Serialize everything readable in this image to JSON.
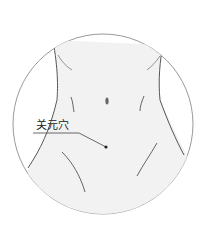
{
  "diagram": {
    "acupoint_label": "关元穴",
    "colors": {
      "outline": "#9a9a9a",
      "body_fill": "#f3f3f3",
      "body_lines": "#555555",
      "point": "#222222",
      "leader": "#444444"
    }
  }
}
